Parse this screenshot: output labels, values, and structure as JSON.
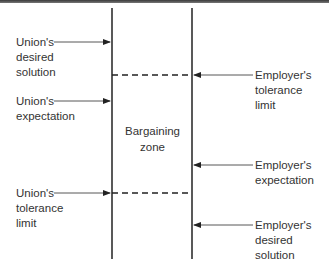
{
  "diagram": {
    "title": "",
    "center_label": "Bargaining\nzone",
    "colors": {
      "line": "#222222",
      "arrow": "#444444",
      "text": "#333333",
      "topbar": "#555555"
    },
    "union_labels": [
      {
        "id": "union-desired-solution",
        "text": "Union's\ndesired\nsolution",
        "arrow_y": 42
      },
      {
        "id": "union-expectation",
        "text": "Union's\nexpectation",
        "arrow_y": 101
      },
      {
        "id": "union-tolerance-limit",
        "text": "Union's\ntolerance\nlimit",
        "arrow_y": 193
      }
    ],
    "employer_labels": [
      {
        "id": "employer-tolerance-limit",
        "text": "Employer's\ntolerance\nlimit",
        "arrow_y": 75
      },
      {
        "id": "employer-expectation",
        "text": "Employer's\nexpectation",
        "arrow_y": 165
      },
      {
        "id": "employer-desired-solution",
        "text": "Employer's\ndesired\nsolution",
        "arrow_y": 225
      }
    ]
  }
}
